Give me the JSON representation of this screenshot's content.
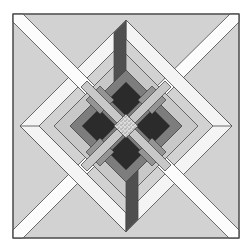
{
  "figure": {
    "name": "quilt-block-pattern",
    "canvas": {
      "width": 252,
      "height": 251,
      "background": "#ffffff"
    },
    "colors": {
      "square_fill": "#d2d2d2",
      "outline": "#4a4a4a",
      "ribbon_white": "#fcfcfc",
      "ring_white": "#f4f4f4",
      "light_band": "#c8c8c8",
      "motif_base": "#7d7d7d",
      "motif_diamond": "#949494",
      "black_arm": "#2b2b2b",
      "dark_strip": "#4f4f4f",
      "speckle_bg": "#dcdcdc",
      "speckle_dot": "#5a5a5a"
    },
    "square": {
      "x": 13,
      "y": 14,
      "w": 226,
      "h": 224
    },
    "shapes": [
      {
        "name": "diamond-ring-white",
        "type": "path",
        "fill": "ring_white",
        "d": "M126,20 L232,126 L126,232 L20,126 Z M126,39 L213,126 L126,213 L39,126 Z"
      },
      {
        "name": "corner-ribbon-nw",
        "type": "polygon",
        "fill": "ribbon_white",
        "points": "13,22 13,14 23,14 104.5,95.5 95.5,104.5"
      },
      {
        "name": "corner-ribbon-ne",
        "type": "polygon",
        "fill": "ribbon_white",
        "points": "230,14 239,14 239,22 156.5,104.5 147.5,95.5"
      },
      {
        "name": "corner-ribbon-sw",
        "type": "polygon",
        "fill": "ribbon_white",
        "points": "13,230 13,238 23,238 104.5,156.5 95.5,147.5"
      },
      {
        "name": "corner-ribbon-se",
        "type": "polygon",
        "fill": "ribbon_white",
        "points": "239,230 239,238 229,238 147.5,156.5 156.5,147.5"
      },
      {
        "name": "ring-band-ne-over",
        "type": "polygon",
        "fill": "ring_white",
        "points": "126,20 232,126 213,126 126,39"
      },
      {
        "name": "ring-band-sw-over",
        "type": "polygon",
        "fill": "ring_white",
        "points": "20,126 126,232 126,213 39,126"
      },
      {
        "name": "diamond-ring-light",
        "type": "path",
        "fill": "light_band",
        "d": "M126,54 L198,126 L126,198 L54,126 Z M126,70 L182,126 L126,182 L70,126 Z"
      },
      {
        "name": "motif-base",
        "type": "polygon",
        "fill": "motif_base",
        "points": "126,70 182,126 126,182 70,126"
      },
      {
        "name": "black-arm-north",
        "type": "polygon",
        "fill": "black_arm",
        "points": "126,82 143,99 126,116 109,99"
      },
      {
        "name": "black-arm-east",
        "type": "polygon",
        "fill": "black_arm",
        "points": "136,126 153,109 170,126 153,143"
      },
      {
        "name": "black-arm-south",
        "type": "polygon",
        "fill": "black_arm",
        "points": "126,136 143,153 126,170 109,153"
      },
      {
        "name": "black-arm-west",
        "type": "polygon",
        "fill": "black_arm",
        "points": "82,126 99,109 116,126 99,143"
      },
      {
        "name": "gray-diamond-nw",
        "type": "polygon",
        "fill": "motif_diamond",
        "points": "100,86 114,100 100,114 86,100"
      },
      {
        "name": "gray-diamond-ne",
        "type": "polygon",
        "fill": "motif_diamond",
        "points": "152,86 166,100 152,114 138,100"
      },
      {
        "name": "gray-diamond-se",
        "type": "polygon",
        "fill": "motif_diamond",
        "points": "152,138 166,152 152,166 138,152"
      },
      {
        "name": "gray-diamond-sw",
        "type": "polygon",
        "fill": "motif_diamond",
        "points": "100,138 114,152 100,166 86,152"
      },
      {
        "name": "x-band-nw-se",
        "type": "polygon",
        "fill": "light_band",
        "points": "81,87 87,81 171,165 165,171"
      },
      {
        "name": "x-band-ne-sw",
        "type": "polygon",
        "fill": "light_band",
        "points": "165,81 171,87 87,171 81,165"
      },
      {
        "name": "center-speckle-diamond",
        "type": "polygon",
        "fill": "pattern:speckle",
        "points": "126,114 138,126 126,138 114,126"
      },
      {
        "name": "dark-strip-top",
        "type": "polygon",
        "fill": "dark_strip",
        "points": "114,33 126,21 126,70 114,82"
      },
      {
        "name": "dark-strip-bottom",
        "type": "polygon",
        "fill": "dark_strip",
        "points": "126,231 138,219 138,170 126,182"
      }
    ]
  }
}
